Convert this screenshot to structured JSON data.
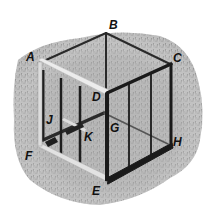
{
  "diagram": {
    "colors": {
      "background": "#ffffff",
      "grass_light": "#c8c8c8",
      "grass_dark": "#7a7a7a",
      "frame_dark": "#1e1e1e",
      "frame_light": "#e6e6e6"
    },
    "labels": [
      {
        "id": "A",
        "text": "A",
        "x": 26,
        "y": 61
      },
      {
        "id": "B",
        "text": "B",
        "x": 109,
        "y": 29
      },
      {
        "id": "C",
        "text": "C",
        "x": 173,
        "y": 62
      },
      {
        "id": "D",
        "text": "D",
        "x": 92,
        "y": 101
      },
      {
        "id": "E",
        "text": "E",
        "x": 92,
        "y": 195
      },
      {
        "id": "F",
        "text": "F",
        "x": 25,
        "y": 160
      },
      {
        "id": "G",
        "text": "G",
        "x": 110,
        "y": 132
      },
      {
        "id": "H",
        "text": "H",
        "x": 173,
        "y": 146
      },
      {
        "id": "J",
        "text": "J",
        "x": 46,
        "y": 124
      },
      {
        "id": "K",
        "text": "K",
        "x": 84,
        "y": 141
      }
    ],
    "vertices": {
      "A": [
        40,
        62
      ],
      "B": [
        106,
        33
      ],
      "C": [
        170,
        64
      ],
      "D": [
        107,
        93
      ],
      "E": [
        107,
        180
      ],
      "F": [
        40,
        148
      ],
      "H": [
        172,
        145
      ]
    }
  }
}
